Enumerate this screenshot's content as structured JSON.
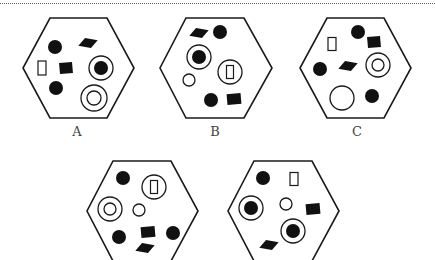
{
  "figure": {
    "labels": [
      "A",
      "B",
      "C"
    ],
    "colors": {
      "stroke": "#1a1a1a",
      "fill": "#111111",
      "label": "#444444"
    },
    "hexagons": [
      {
        "id": "A",
        "label": "A",
        "vertices": [
          [
            50,
            18
          ],
          [
            107,
            18
          ],
          [
            134,
            68
          ],
          [
            107,
            118
          ],
          [
            50,
            118
          ],
          [
            23,
            68
          ]
        ],
        "label_pos": [
          77,
          136
        ],
        "shapes": [
          {
            "type": "dot",
            "x": 55,
            "y": 47,
            "r": 7
          },
          {
            "type": "diamond",
            "x": 88,
            "y": 43,
            "w": 20,
            "h": 11,
            "rot": -25
          },
          {
            "type": "rect-outline",
            "x": 42,
            "y": 68,
            "w": 8,
            "h": 14
          },
          {
            "type": "filled-rect",
            "x": 66,
            "y": 68,
            "w": 13,
            "h": 11,
            "rot": -5
          },
          {
            "type": "ring-dot",
            "x": 101,
            "y": 68,
            "r": 12,
            "r2": 7
          },
          {
            "type": "dot",
            "x": 56,
            "y": 88,
            "r": 7
          },
          {
            "type": "ring-ring",
            "x": 94,
            "y": 98,
            "r": 13,
            "r2": 7
          }
        ]
      },
      {
        "id": "B",
        "label": "B",
        "vertices": [
          [
            186,
            18
          ],
          [
            244,
            18
          ],
          [
            272,
            68
          ],
          [
            244,
            118
          ],
          [
            186,
            118
          ],
          [
            160,
            68
          ]
        ],
        "label_pos": [
          215,
          136
        ],
        "shapes": [
          {
            "type": "diamond",
            "x": 199,
            "y": 33,
            "w": 20,
            "h": 11,
            "rot": -25
          },
          {
            "type": "dot",
            "x": 220,
            "y": 32,
            "r": 7
          },
          {
            "type": "ring-dot",
            "x": 199,
            "y": 57,
            "r": 12,
            "r2": 7
          },
          {
            "type": "ring-rect",
            "x": 230,
            "y": 72,
            "r": 12,
            "w": 7,
            "h": 13
          },
          {
            "type": "circle-outline",
            "x": 189,
            "y": 80,
            "r": 6
          },
          {
            "type": "dot",
            "x": 211,
            "y": 100,
            "r": 7
          },
          {
            "type": "filled-rect",
            "x": 234,
            "y": 99,
            "w": 14,
            "h": 11,
            "rot": -5
          }
        ]
      },
      {
        "id": "C",
        "label": "C",
        "vertices": [
          [
            327,
            18
          ],
          [
            384,
            18
          ],
          [
            411,
            68
          ],
          [
            384,
            118
          ],
          [
            327,
            118
          ],
          [
            300,
            68
          ]
        ],
        "label_pos": [
          357,
          136
        ],
        "shapes": [
          {
            "type": "dot",
            "x": 358,
            "y": 32,
            "r": 7
          },
          {
            "type": "rect-outline",
            "x": 332,
            "y": 44,
            "w": 8,
            "h": 13
          },
          {
            "type": "filled-rect",
            "x": 374,
            "y": 42,
            "w": 13,
            "h": 11,
            "rot": -5
          },
          {
            "type": "dot",
            "x": 320,
            "y": 69,
            "r": 7
          },
          {
            "type": "diamond",
            "x": 348,
            "y": 66,
            "w": 20,
            "h": 11,
            "rot": -25
          },
          {
            "type": "ring-ring",
            "x": 378,
            "y": 65,
            "r": 12,
            "r2": 6
          },
          {
            "type": "circle-outline",
            "x": 342,
            "y": 98,
            "r": 12
          },
          {
            "type": "dot",
            "x": 372,
            "y": 96,
            "r": 7
          }
        ]
      },
      {
        "id": "D",
        "label": "",
        "vertices": [
          [
            113,
            161
          ],
          [
            171,
            161
          ],
          [
            198,
            211
          ],
          [
            171,
            261
          ],
          [
            113,
            261
          ],
          [
            87,
            211
          ]
        ],
        "shapes": [
          {
            "type": "dot",
            "x": 123,
            "y": 178,
            "r": 7
          },
          {
            "type": "ring-rect",
            "x": 154,
            "y": 187,
            "r": 12,
            "w": 7,
            "h": 13
          },
          {
            "type": "ring-ring",
            "x": 110,
            "y": 209,
            "r": 12,
            "r2": 6
          },
          {
            "type": "circle-outline",
            "x": 139,
            "y": 210,
            "r": 6
          },
          {
            "type": "dot",
            "x": 119,
            "y": 237,
            "r": 7
          },
          {
            "type": "filled-rect",
            "x": 148,
            "y": 232,
            "w": 14,
            "h": 11,
            "rot": -5
          },
          {
            "type": "dot",
            "x": 173,
            "y": 233,
            "r": 7
          },
          {
            "type": "diamond",
            "x": 145,
            "y": 248,
            "w": 20,
            "h": 11,
            "rot": -25
          }
        ]
      },
      {
        "id": "E",
        "label": "",
        "vertices": [
          [
            254,
            161
          ],
          [
            312,
            161
          ],
          [
            339,
            211
          ],
          [
            312,
            261
          ],
          [
            254,
            261
          ],
          [
            228,
            211
          ]
        ],
        "shapes": [
          {
            "type": "dot",
            "x": 263,
            "y": 178,
            "r": 7
          },
          {
            "type": "rect-outline",
            "x": 294,
            "y": 179,
            "w": 8,
            "h": 13
          },
          {
            "type": "ring-dot",
            "x": 251,
            "y": 208,
            "r": 12,
            "r2": 7
          },
          {
            "type": "circle-outline",
            "x": 286,
            "y": 204,
            "r": 6
          },
          {
            "type": "filled-rect",
            "x": 313,
            "y": 209,
            "w": 14,
            "h": 11,
            "rot": -5
          },
          {
            "type": "ring-dot",
            "x": 293,
            "y": 231,
            "r": 12,
            "r2": 7
          },
          {
            "type": "diamond",
            "x": 269,
            "y": 245,
            "w": 20,
            "h": 11,
            "rot": -25
          }
        ]
      }
    ]
  }
}
